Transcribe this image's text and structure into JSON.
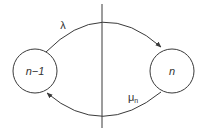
{
  "diagram": {
    "type": "state-transition",
    "states": [
      {
        "id": "left",
        "label": "n−1",
        "cx": 35,
        "cy": 71,
        "r": 22
      },
      {
        "id": "right",
        "label": "n",
        "cx": 172,
        "cy": 71,
        "r": 22
      }
    ],
    "transitions": [
      {
        "from": "left",
        "to": "right",
        "label": "λ",
        "position": "top"
      },
      {
        "from": "right",
        "to": "left",
        "label": "μ",
        "subscript": "n",
        "position": "bottom"
      }
    ],
    "divider": {
      "x": 102,
      "y1": 4,
      "y2": 128
    },
    "colors": {
      "stroke": "#3a3a3a",
      "text": "#333333",
      "background": "#ffffff"
    }
  }
}
